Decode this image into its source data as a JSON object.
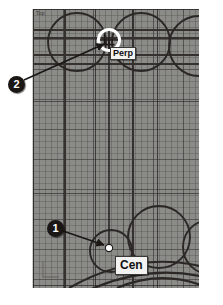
{
  "app": {
    "type": "cad-drawing-viewport",
    "background_color": "#8b8b88",
    "geometry_color": "#2a2725",
    "page_background": "#ffffff"
  },
  "viewport": {
    "corner_label": "Top",
    "grid": "on",
    "ucs_icon": "ucs-l-icon"
  },
  "snap_markers": [
    {
      "id": "perp",
      "label": "Perp",
      "type": "perpendicular-snap",
      "aperture": "white-circle",
      "x": 108,
      "y": 40
    },
    {
      "id": "cen",
      "label": "Cen",
      "type": "center-snap",
      "aperture": "white-dot",
      "x": 108,
      "y": 248
    }
  ],
  "callouts": [
    {
      "id": "callout-1",
      "number": "1",
      "points_to": "cen",
      "color": "#1a1715"
    },
    {
      "id": "callout-2",
      "number": "2",
      "points_to": "perp",
      "color": "#1a1715"
    }
  ],
  "construction_line": {
    "name": "perpendicular-construction-line",
    "from_x": 108,
    "from_y": 40,
    "to_x": 108,
    "to_y": 248
  }
}
